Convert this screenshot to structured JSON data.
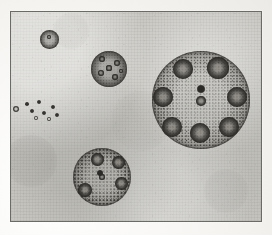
{
  "plate": {
    "title": "Volvox colonies microscope plate",
    "medium": "engraved stipple illustration on mottled paper",
    "frame": {
      "x": 10,
      "y": 11,
      "width": 252,
      "height": 211,
      "border_color": "#6a6a66",
      "paper_color": "#c9c8c3",
      "ink_color": "#2b2a27"
    },
    "margin_color": "#f3f2ef"
  },
  "specimens": [
    {
      "id": "large-colony",
      "label": "Large Volvox colony with eight daughter colonies",
      "cx": 200,
      "cy": 99,
      "r": 49,
      "daughters": [
        {
          "cx": 182,
          "cy": 68,
          "r": 10
        },
        {
          "cx": 217,
          "cy": 67,
          "r": 11
        },
        {
          "cx": 236,
          "cy": 96,
          "r": 10
        },
        {
          "cx": 228,
          "cy": 126,
          "r": 10
        },
        {
          "cx": 199,
          "cy": 132,
          "r": 10
        },
        {
          "cx": 171,
          "cy": 126,
          "r": 10
        },
        {
          "cx": 162,
          "cy": 96,
          "r": 10
        },
        {
          "cx": 200,
          "cy": 100,
          "r": 5
        }
      ],
      "center_cell": {
        "cx": 200,
        "cy": 88,
        "r": 4
      }
    },
    {
      "id": "bottom-colony",
      "label": "Medium Volvox colony with five daughter colonies",
      "cx": 101,
      "cy": 176,
      "r": 29,
      "daughters": [
        {
          "cx": 96,
          "cy": 158,
          "r": 6.5
        },
        {
          "cx": 117,
          "cy": 161,
          "r": 6.5
        },
        {
          "cx": 120,
          "cy": 182,
          "r": 6.5
        },
        {
          "cx": 84,
          "cy": 189,
          "r": 7
        },
        {
          "cx": 101,
          "cy": 176,
          "r": 3.2
        }
      ],
      "center_cell": {
        "cx": 99,
        "cy": 172,
        "r": 2.8
      }
    },
    {
      "id": "middle-colony",
      "label": "Small Volvox colony with six internal cells",
      "cx": 108,
      "cy": 68,
      "r": 18,
      "daughters": [
        {
          "cx": 101,
          "cy": 58,
          "r": 3.2
        },
        {
          "cx": 116,
          "cy": 62,
          "r": 3.0
        },
        {
          "cx": 100,
          "cy": 72,
          "r": 3.4
        },
        {
          "cx": 114,
          "cy": 76,
          "r": 3.0
        },
        {
          "cx": 108,
          "cy": 67,
          "r": 2.6
        },
        {
          "cx": 120,
          "cy": 70,
          "r": 2.4
        }
      ],
      "center_cell": null
    },
    {
      "id": "top-small-sphere",
      "label": "Small dense young colony",
      "cx": 48,
      "cy": 38,
      "r": 9.5,
      "daughters": [
        {
          "cx": 48,
          "cy": 36,
          "r": 2.2
        }
      ],
      "center_cell": null
    }
  ],
  "free_cells": [
    {
      "cx": 15,
      "cy": 108,
      "r": 3.4,
      "ringed": true
    },
    {
      "cx": 38,
      "cy": 101,
      "r": 2.4,
      "ringed": false
    },
    {
      "cx": 31,
      "cy": 110,
      "r": 2.2,
      "ringed": false
    },
    {
      "cx": 43,
      "cy": 112,
      "r": 2.2,
      "ringed": false
    },
    {
      "cx": 52,
      "cy": 106,
      "r": 2.2,
      "ringed": false
    },
    {
      "cx": 56,
      "cy": 114,
      "r": 2.3,
      "ringed": false
    },
    {
      "cx": 35,
      "cy": 117,
      "r": 2.3,
      "ringed": true
    },
    {
      "cx": 48,
      "cy": 118,
      "r": 2.4,
      "ringed": true
    },
    {
      "cx": 26,
      "cy": 103,
      "r": 1.8,
      "ringed": false
    }
  ],
  "stains": [
    {
      "cx": 30,
      "cy": 160,
      "r": 26,
      "opacity": 0.1
    },
    {
      "cx": 225,
      "cy": 190,
      "r": 22,
      "opacity": 0.07
    },
    {
      "cx": 70,
      "cy": 30,
      "r": 18,
      "opacity": 0.06
    },
    {
      "cx": 140,
      "cy": 120,
      "r": 30,
      "opacity": 0.05
    }
  ]
}
